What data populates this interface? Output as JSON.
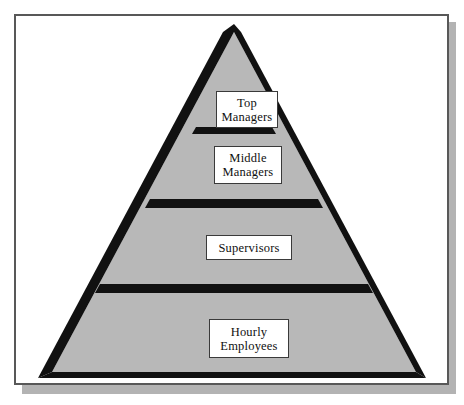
{
  "figure": {
    "type": "pyramid-hierarchy-diagram",
    "colors": {
      "pyramid_fill": "#b8b8b8",
      "pyramid_outline": "#111111",
      "divider_band": "#111111",
      "label_box_fill": "#ffffff",
      "label_box_border": "#3a3a3a",
      "frame_border": "#585858",
      "drop_shadow": "#b3b3b3",
      "page_background": "#ffffff"
    },
    "levels": [
      {
        "id": "top-managers",
        "rank": 1,
        "lines": [
          "Top",
          "Managers"
        ],
        "text": "Top Managers"
      },
      {
        "id": "middle-managers",
        "rank": 2,
        "lines": [
          "Middle",
          "Managers"
        ],
        "text": "Middle Managers"
      },
      {
        "id": "supervisors",
        "rank": 3,
        "lines": [
          "Supervisors"
        ],
        "text": "Supervisors"
      },
      {
        "id": "hourly-employees",
        "rank": 4,
        "lines": [
          "Hourly",
          "Employees"
        ],
        "text": "Hourly Employees"
      }
    ]
  }
}
